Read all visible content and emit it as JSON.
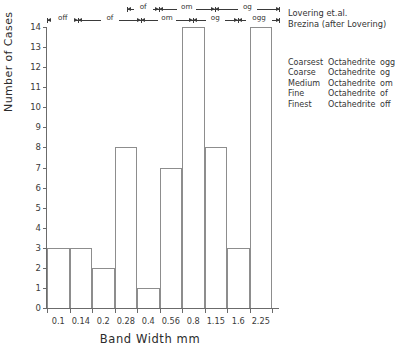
{
  "chart_data": {
    "type": "bar",
    "title": "",
    "xlabel": "Band Width mm",
    "ylabel": "Number of Cases",
    "categories": [
      "0.1",
      "0.14",
      "0.2",
      "0.28",
      "0.4",
      "0.56",
      "0.8",
      "1.15",
      "1.6",
      "2.25"
    ],
    "values": [
      3,
      3,
      2,
      8,
      1,
      7,
      14,
      8,
      3,
      14
    ],
    "ylim": [
      0,
      14
    ],
    "yticks": [
      0,
      1,
      2,
      3,
      4,
      5,
      6,
      7,
      8,
      9,
      10,
      11,
      12,
      13,
      14
    ],
    "xtick_labels": [
      "0.1",
      "0.14",
      "0.2",
      "0.28",
      "0.4",
      "0.56",
      "0.8",
      "1.15",
      "1.6",
      "2.25"
    ],
    "x_scale": "log",
    "grid": false,
    "legend_position": "top-right"
  },
  "axes": {
    "y_title": "Number of Cases",
    "x_title": "Band Width mm",
    "y_ticks": [
      "0",
      "1",
      "2",
      "3",
      "4",
      "5",
      "6",
      "7",
      "8",
      "9",
      "10",
      "11",
      "12",
      "13",
      "14"
    ],
    "x_ticks": [
      "0.1",
      "0.14",
      "0.2",
      "0.28",
      "0.4",
      "0.56",
      "0.8",
      "1.15",
      "1.6",
      "2.25"
    ]
  },
  "scales": {
    "upper": {
      "source": "Lovering et.al.",
      "segments": [
        {
          "label": "of",
          "left_pct": 34.5,
          "right_pct": 48.0
        },
        {
          "label": "om",
          "left_pct": 48.0,
          "right_pct": 72.0
        },
        {
          "label": "og",
          "left_pct": 72.0,
          "right_pct": 100.0
        }
      ]
    },
    "lower": {
      "source": "Brezina (after Lovering)",
      "segments": [
        {
          "label": "off",
          "left_pct": 0.0,
          "right_pct": 13.5
        },
        {
          "label": "of",
          "left_pct": 13.5,
          "right_pct": 40.5
        },
        {
          "label": "om",
          "left_pct": 40.5,
          "right_pct": 62.5
        },
        {
          "label": "og",
          "left_pct": 62.5,
          "right_pct": 82.0
        },
        {
          "label": "ogg",
          "left_pct": 82.0,
          "right_pct": 100.0
        }
      ]
    }
  },
  "sources": {
    "line1": "Lovering et.al.",
    "line2": "Brezina (after Lovering)"
  },
  "classification": {
    "rows": [
      {
        "grade": "Coarsest",
        "type": "Octahedrite",
        "code": "ogg"
      },
      {
        "grade": "Coarse",
        "type": "Octahedrite",
        "code": "og"
      },
      {
        "grade": "Medium",
        "type": "Octahedrite",
        "code": "om"
      },
      {
        "grade": "Fine",
        "type": "Octahedrite",
        "code": "of"
      },
      {
        "grade": "Finest",
        "type": "Octahedrite",
        "code": "off"
      }
    ]
  },
  "colors": {
    "bar_outline": "#8d8d8d",
    "axis": "#6b6b6b",
    "text": "#2b2b2b",
    "background": "#ffffff"
  }
}
